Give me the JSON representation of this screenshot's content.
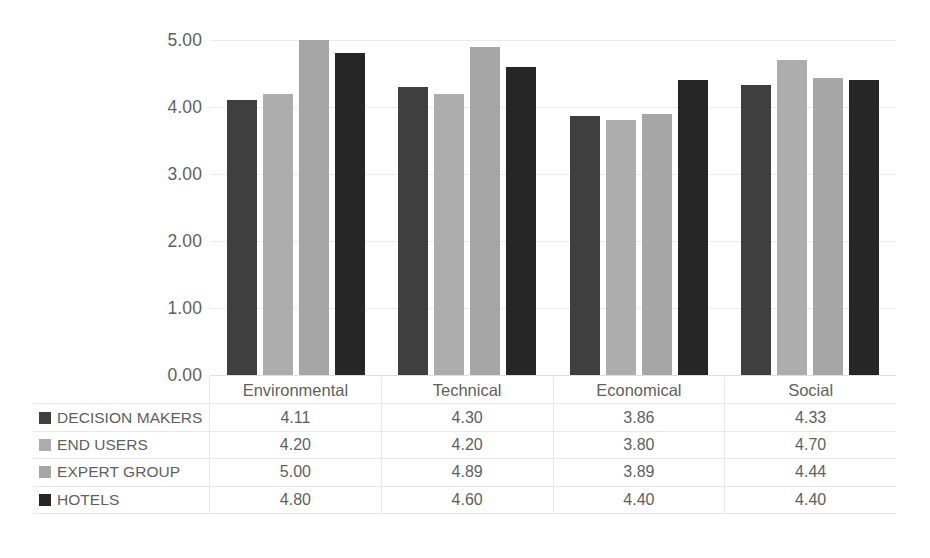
{
  "chart_data": {
    "type": "bar",
    "title": "",
    "subtitle": "",
    "xlabel": "",
    "ylabel": "",
    "categories": [
      "Environmental",
      "Technical",
      "Economical",
      "Social"
    ],
    "series": [
      {
        "name": "DECISION MAKERS",
        "color": "#3f3f3f",
        "values": [
          4.11,
          4.3,
          3.86,
          4.33
        ],
        "labels": [
          "4.11",
          "4.30",
          "3.86",
          "4.33"
        ]
      },
      {
        "name": "END USERS",
        "color": "#adadad",
        "values": [
          4.2,
          4.2,
          3.8,
          4.7
        ],
        "labels": [
          "4.20",
          "4.20",
          "3.80",
          "4.70"
        ]
      },
      {
        "name": "EXPERT GROUP",
        "color": "#a6a6a6",
        "values": [
          5.0,
          4.89,
          3.89,
          4.44
        ],
        "labels": [
          "5.00",
          "4.89",
          "3.89",
          "4.44"
        ]
      },
      {
        "name": "HOTELS",
        "color": "#262626",
        "values": [
          4.8,
          4.6,
          4.4,
          4.4
        ],
        "labels": [
          "4.80",
          "4.60",
          "4.40",
          "4.40"
        ]
      }
    ],
    "ylim": [
      0,
      5
    ],
    "ytick_labels": [
      "5.00",
      "4.00",
      "3.00",
      "2.00",
      "1.00",
      "0.00"
    ],
    "ytick_values": [
      5,
      4,
      3,
      2,
      1,
      0
    ],
    "grid": true,
    "legend_position": "data-table",
    "data_table_visible": true,
    "background_color": "#ffffff",
    "grid_color": "#eceaea",
    "text_color": "#5f5f5f"
  }
}
